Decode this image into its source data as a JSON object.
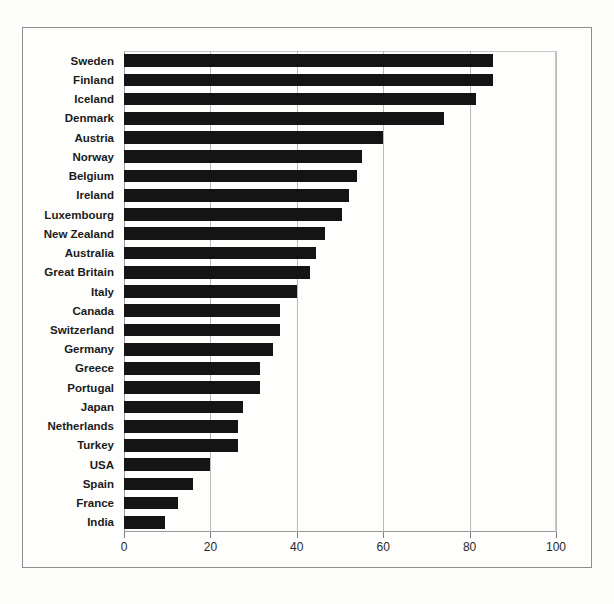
{
  "chart_data": {
    "type": "bar",
    "orientation": "horizontal",
    "title": "",
    "subtitle": "",
    "xlabel": "",
    "ylabel": "",
    "xlim": [
      0,
      100
    ],
    "ylim": null,
    "grid": "vertical",
    "legend": "none",
    "xticks": [
      0,
      20,
      40,
      60,
      80,
      100
    ],
    "xticklabels": [
      "0",
      "20",
      "40",
      "60",
      "80",
      "100"
    ],
    "bar_color": "#141414",
    "categories": [
      "Sweden",
      "Finland",
      "Iceland",
      "Denmark",
      "Austria",
      "Norway",
      "Belgium",
      "Ireland",
      "Luxembourg",
      "New Zealand",
      "Australia",
      "Great Britain",
      "Italy",
      "Canada",
      "Switzerland",
      "Germany",
      "Greece",
      "Portugal",
      "Japan",
      "Netherlands",
      "Turkey",
      "USA",
      "Spain",
      "France",
      "India"
    ],
    "values": [
      85.5,
      85.5,
      81.5,
      74,
      60,
      55,
      54,
      52,
      50.5,
      46.5,
      44.5,
      43,
      40,
      36,
      36,
      34.5,
      31.5,
      31.5,
      27.5,
      26.5,
      26.5,
      20,
      16,
      12.5,
      9.5
    ]
  },
  "caption": ""
}
